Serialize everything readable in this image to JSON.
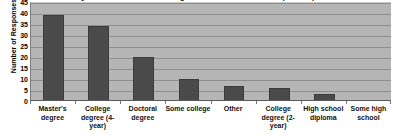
{
  "chart_data": {
    "type": "bar",
    "title": "Question 1: What is the highest level of education? (n = 118)",
    "xlabel": "",
    "ylabel": "Number of Responses",
    "ylim": [
      0,
      45
    ],
    "ytick_step": 5,
    "yticks": [
      "45",
      "40",
      "35",
      "30",
      "25",
      "20",
      "15",
      "10",
      "5",
      "0"
    ],
    "grid": true,
    "legend": "none",
    "bar_color": "#4a4a4a",
    "plot_background": "#b5b5b5",
    "figure_background": "#ffffff",
    "categories": [
      "Master's degree",
      "College degree (4-year)",
      "Doctoral degree",
      "Some college",
      "Other",
      "College degree (2-year)",
      "High school diploma",
      "Some high school"
    ],
    "values": [
      39,
      34,
      20,
      9.8,
      6.6,
      5.7,
      3,
      0
    ]
  }
}
